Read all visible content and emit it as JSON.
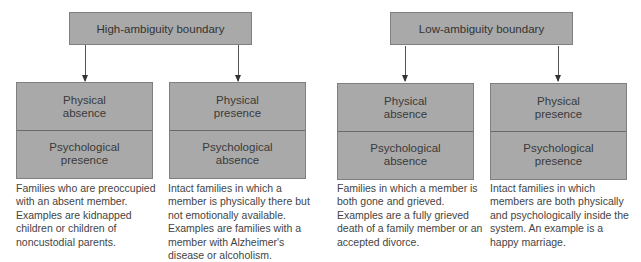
{
  "diagram": {
    "groups": [
      {
        "title": "High-ambiguity boundary",
        "boxes": [
          {
            "physical": "Physical absence",
            "psychological": "Psychological presence",
            "description": "Families who are preoccupied with an absent member. Examples are kidnapped children or children of noncustodial parents."
          },
          {
            "physical": "Physical presence",
            "psychological": "Psychological absence",
            "description": "Intact families in which a member is physically there but not emotionally available. Examples are families with a member with Alzheimer's disease or alcoholism."
          }
        ]
      },
      {
        "title": "Low-ambiguity boundary",
        "boxes": [
          {
            "physical": "Physical absence",
            "psychological": "Psychological absence",
            "description": "Families in which a member is both gone and grieved. Examples are a fully grieved death of a family member or an accepted divorce."
          },
          {
            "physical": "Physical presence",
            "psychological": "Psychological presence",
            "description": "Intact families in which members are both physically and psychologically inside the system. An example is a happy marriage."
          }
        ]
      }
    ],
    "colors": {
      "box_fill": "#a9a9a9",
      "box_border": "#7f7f7f",
      "text": "#3a3a3a"
    }
  }
}
